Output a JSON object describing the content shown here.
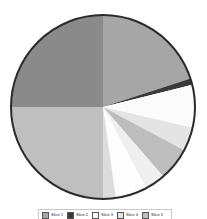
{
  "figure": {
    "background_color": "#ffffff",
    "width": 207,
    "height": 219
  },
  "pie": {
    "center_x": 103,
    "center_y": 107,
    "radius": 92,
    "outline_color": "#2b2b2b",
    "outline_width": 2,
    "start_angle_deg": 0,
    "direction": "clockwise"
  },
  "legend": {
    "border_color": "#c9c9c9",
    "background_color": "#ffffff",
    "visible_clipped": true
  },
  "chart_data": {
    "type": "pie",
    "title": "",
    "subtitle": "",
    "xlabel": "",
    "ylabel": "",
    "legend_position": "bottom",
    "grid": false,
    "start_angle_deg": 90,
    "counterclock": false,
    "categories": [
      "Slice 1",
      "Slice 2",
      "Slice 3",
      "Slice 4",
      "Slice 5",
      "Slice 6",
      "Slice 7",
      "Slice 8",
      "Slice 9"
    ],
    "values": [
      20.0,
      1.1,
      7.5,
      4.2,
      5.8,
      3.6,
      5.6,
      2.2,
      50.0
    ],
    "angles_deg": [
      72,
      4,
      27,
      15,
      21,
      13,
      20,
      8,
      180
    ],
    "colors": [
      "#a6a6a6",
      "#3a3a3a",
      "#fbfbfb",
      "#e4e4e4",
      "#bdbdbd",
      "#efefef",
      "#fdfdfd",
      "#dcdcdc",
      "#b5b5b5"
    ],
    "slices": [
      {
        "label": "Slice 1",
        "value": 20.0,
        "angle_deg": 72,
        "color": "#a6a6a6",
        "start_deg": 0,
        "end_deg": 72
      },
      {
        "label": "Slice 2",
        "value": 1.1,
        "angle_deg": 4,
        "color": "#3a3a3a",
        "start_deg": 72,
        "end_deg": 76
      },
      {
        "label": "Slice 3",
        "value": 7.5,
        "angle_deg": 27,
        "color": "#fbfbfb",
        "start_deg": 76,
        "end_deg": 103
      },
      {
        "label": "Slice 4",
        "value": 4.2,
        "angle_deg": 15,
        "color": "#e4e4e4",
        "start_deg": 103,
        "end_deg": 118
      },
      {
        "label": "Slice 5",
        "value": 5.8,
        "angle_deg": 21,
        "color": "#bdbdbd",
        "start_deg": 118,
        "end_deg": 139
      },
      {
        "label": "Slice 6",
        "value": 3.6,
        "angle_deg": 13,
        "color": "#efefef",
        "start_deg": 139,
        "end_deg": 152
      },
      {
        "label": "Slice 7",
        "value": 5.6,
        "angle_deg": 20,
        "color": "#fdfdfd",
        "start_deg": 152,
        "end_deg": 172
      },
      {
        "label": "Slice 8",
        "value": 2.2,
        "angle_deg": 8,
        "color": "#dcdcdc",
        "start_deg": 172,
        "end_deg": 180
      },
      {
        "label": "Slice 9",
        "value": 50.0,
        "angle_deg": 180,
        "color": "#b5b5b5",
        "start_deg": 180,
        "end_deg": 360
      }
    ],
    "large_left_lower_slice": {
      "color": "#bfbfbf",
      "start_deg": 180,
      "end_deg": 270
    },
    "large_left_upper_slice": {
      "color": "#8a8a8a",
      "start_deg": 270,
      "end_deg": 360
    }
  }
}
